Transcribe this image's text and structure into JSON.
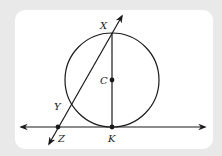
{
  "diagram": {
    "type": "geometry",
    "colors": {
      "frame": "#e9e9e9",
      "panel": "#ffffff",
      "stroke": "#1a1a1a"
    },
    "circle": {
      "center_label": "C",
      "cx": 112,
      "cy": 80,
      "r": 47
    },
    "points": [
      {
        "id": "X",
        "label": "X",
        "x": 112,
        "y": 33
      },
      {
        "id": "C",
        "label": "C",
        "x": 112,
        "y": 80
      },
      {
        "id": "Y",
        "label": "Y",
        "x": 71,
        "y": 106
      },
      {
        "id": "Z",
        "label": "Z",
        "x": 58,
        "y": 127
      },
      {
        "id": "K",
        "label": "K",
        "x": 112,
        "y": 127
      }
    ],
    "segments": [
      {
        "from": "X",
        "to": "K",
        "kind": "diameter"
      }
    ],
    "lines": [
      {
        "through": [
          "Z",
          "K"
        ],
        "kind": "tangent-line",
        "arrows": "both"
      },
      {
        "through": [
          "Z",
          "Y",
          "X"
        ],
        "kind": "secant-line",
        "arrows": "both"
      }
    ],
    "labels": {
      "X": "X",
      "C": "C",
      "Y": "Y",
      "Z": "Z",
      "K": "K"
    }
  }
}
